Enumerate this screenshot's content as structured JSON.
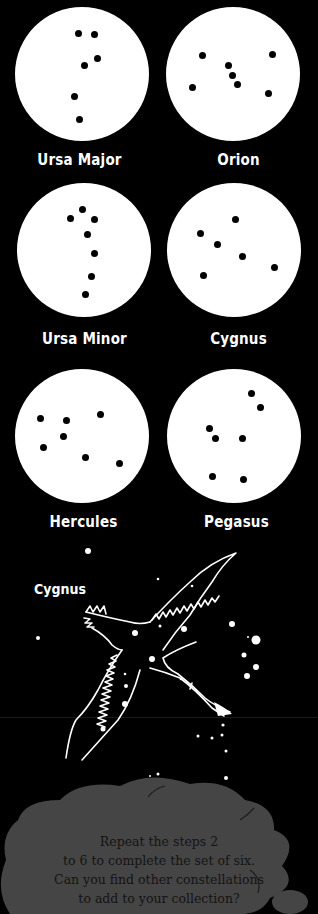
{
  "constellations": [
    {
      "name": "Ursa Major",
      "stars": [
        [
          78,
          33
        ],
        [
          94,
          34
        ],
        [
          97,
          58
        ],
        [
          84,
          65
        ],
        [
          74,
          96
        ],
        [
          79,
          119
        ]
      ]
    },
    {
      "name": "Orion",
      "stars": [
        [
          202,
          55
        ],
        [
          272,
          54
        ],
        [
          228,
          65
        ],
        [
          232,
          75
        ],
        [
          237,
          84
        ],
        [
          192,
          87
        ],
        [
          268,
          93
        ]
      ]
    },
    {
      "name": "Ursa Minor",
      "stars": [
        [
          82,
          209
        ],
        [
          70,
          218
        ],
        [
          94,
          219
        ],
        [
          87,
          234
        ],
        [
          94,
          253
        ],
        [
          91,
          276
        ],
        [
          85,
          294
        ]
      ]
    },
    {
      "name": "Cygnus",
      "stars": [
        [
          235,
          219
        ],
        [
          200,
          233
        ],
        [
          217,
          244
        ],
        [
          242,
          256
        ],
        [
          274,
          267
        ],
        [
          203,
          275
        ]
      ]
    },
    {
      "name": "Hercules",
      "stars": [
        [
          40,
          418
        ],
        [
          66,
          420
        ],
        [
          100,
          414
        ],
        [
          63,
          436
        ],
        [
          43,
          447
        ],
        [
          85,
          457
        ],
        [
          119,
          463
        ]
      ]
    },
    {
      "name": "Pegasus",
      "stars": [
        [
          251,
          393
        ],
        [
          260,
          407
        ],
        [
          209,
          428
        ],
        [
          215,
          438
        ],
        [
          242,
          438
        ],
        [
          212,
          476
        ],
        [
          243,
          479
        ]
      ]
    }
  ],
  "illustration": {
    "title": "Cygnus"
  },
  "cloud": {
    "lines": [
      "Repeat the steps 2",
      "to 6 to complete the set of six.",
      "Can you find other constellations",
      "to add to your collection?"
    ]
  }
}
